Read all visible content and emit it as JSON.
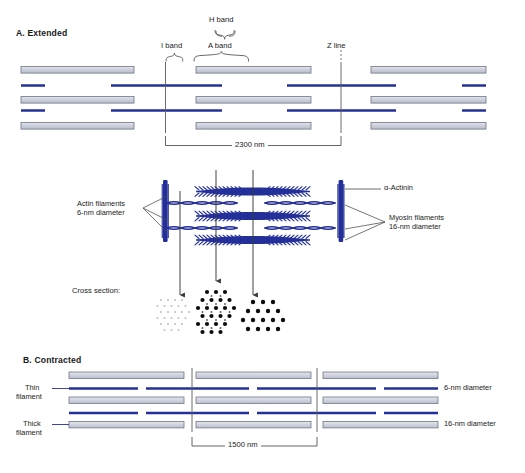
{
  "figure": {
    "type": "scientific-diagram"
  },
  "panel_a": {
    "title": "A.  Extended",
    "labels": {
      "h_band": "H band",
      "i_band": "I band",
      "a_band": "A band",
      "z_line": "Z line"
    },
    "dimension": "2300 nm"
  },
  "midsection": {
    "labels": {
      "actin": "Actin filaments\n6-nm diameter",
      "actin_line1": "Actin filaments",
      "actin_line2": "6-nm diameter",
      "alpha_actinin": "α-Actinin",
      "myosin_line1": "Myosin filaments",
      "myosin_line2": "16-nm diameter",
      "cross_section": "Cross section:"
    },
    "cross_sections": [
      {
        "name": "thin-only",
        "dot_style": "small-light",
        "rows": 6,
        "description": "sparse small light dots - thin filaments only"
      },
      {
        "name": "overlap",
        "dot_style": "mixed-large-small",
        "rows": 6,
        "description": "large dots (myosin) with small dots (actin) interleaved in hexagonal array"
      },
      {
        "name": "thick-only",
        "dot_style": "large-dark",
        "rows": 5,
        "description": "triangular array of large dots - thick filaments only"
      }
    ]
  },
  "panel_b": {
    "title": "B.  Contracted",
    "labels": {
      "thin_line1": "Thin",
      "thin_line2": "filament",
      "thick_line1": "Thick",
      "thick_line2": "filament",
      "thin_diam": "6-nm diameter",
      "thick_diam": "16-nm diameter"
    },
    "dimension": "1500 nm"
  },
  "colors": {
    "thick_filament_fill": "#c9ccd8",
    "thick_filament_stroke": "#6a7288",
    "thin_filament": "#24309a",
    "z_line": "#555555",
    "text": "#1a1a1a",
    "bracket": "#4a4a4a",
    "dot": "#0d0d0d",
    "dot_light": "#c2c2c2"
  }
}
